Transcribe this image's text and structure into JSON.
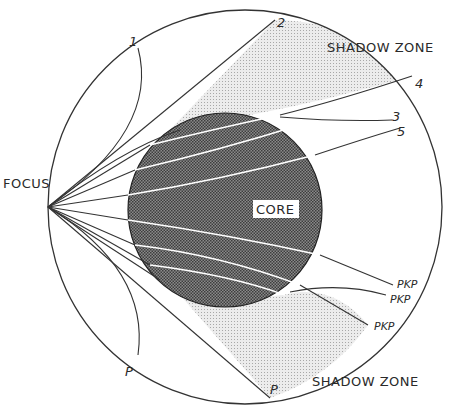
{
  "diagram": {
    "labels": {
      "focus": "FOCUS",
      "core": "CORE",
      "shadow_zone_top": "SHADOW ZONE",
      "shadow_zone_bottom": "SHADOW ZONE"
    },
    "ray_numbers": [
      "1",
      "2",
      "3",
      "4",
      "5"
    ],
    "p_labels": [
      "P",
      "P"
    ],
    "pkp_labels": [
      "PKP",
      "PKP",
      "PKP"
    ],
    "colors": {
      "line": "#333333",
      "core_fill": "#6e6e6e",
      "shadow_fill": "#d9d9d9",
      "background": "#ffffff"
    }
  }
}
